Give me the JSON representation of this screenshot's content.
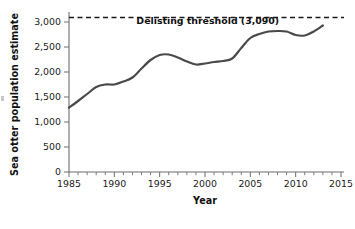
{
  "chart_data": {
    "type": "line",
    "title": "",
    "xlabel": "Year",
    "ylabel": "Sea otter population estimate",
    "xlim": [
      1985,
      2015
    ],
    "ylim": [
      0,
      3100
    ],
    "grid": false,
    "legend": null,
    "x_tick_labels": [
      "1985",
      "1990",
      "1995",
      "2000",
      "2005",
      "2010",
      "2015"
    ],
    "x_major_ticks": [
      1985,
      1990,
      1995,
      2000,
      2005,
      2010,
      2015
    ],
    "x_minor_tick_step": 1,
    "y_tick_labels": [
      "0",
      "500",
      "1,000",
      "1,500",
      "2,000",
      "2,500",
      "3,000"
    ],
    "y_major_ticks": [
      0,
      500,
      1000,
      1500,
      2000,
      2500,
      3000
    ],
    "x": [
      1985,
      1986,
      1987,
      1988,
      1989,
      1990,
      1991,
      1992,
      1993,
      1994,
      1995,
      1996,
      1997,
      1998,
      1999,
      2000,
      2001,
      2002,
      2003,
      2004,
      2005,
      2006,
      2007,
      2008,
      2009,
      2010,
      2011,
      2012,
      2013
    ],
    "series": [
      {
        "name": "Sea otter population estimate",
        "color": "#4a4a4a",
        "values": [
          1290,
          1420,
          1560,
          1700,
          1750,
          1750,
          1810,
          1890,
          2070,
          2240,
          2340,
          2350,
          2290,
          2210,
          2150,
          2170,
          2200,
          2220,
          2270,
          2480,
          2680,
          2760,
          2810,
          2820,
          2810,
          2740,
          2730,
          2810,
          2930
        ]
      }
    ],
    "annotations": [
      {
        "name": "delisting-threshold",
        "label": "Delisting threshold (3,090)",
        "type": "hline",
        "value": 3090,
        "style": "dashed",
        "color": "#1a1a1a",
        "label_x": 2000.3,
        "label_y": 2960
      }
    ]
  }
}
